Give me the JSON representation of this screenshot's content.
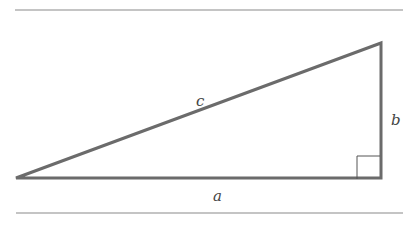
{
  "diagram": {
    "labels": {
      "hypotenuse": "c",
      "vertical_leg": "b",
      "horizontal_leg": "a"
    },
    "colors": {
      "stroke": "#6b6b6b",
      "rule": "#7a7a7a",
      "text": "#444444"
    }
  }
}
